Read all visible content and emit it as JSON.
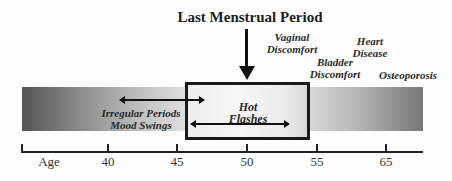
{
  "diagram": {
    "title": "Last Menstrual Period",
    "axis": {
      "label": "Age",
      "ticks": [
        "40",
        "45",
        "50",
        "55",
        "65"
      ]
    },
    "symptoms": {
      "irregular_periods": "Irregular Periods",
      "mood_swings": "Mood Swings",
      "hot_flashes_line1": "Hot",
      "hot_flashes_line2": "Flashes",
      "vaginal_line1": "Vaginal",
      "vaginal_line2": "Discomfort",
      "bladder_line1": "Bladder",
      "bladder_line2": "Discomfort",
      "heart_line1": "Heart",
      "heart_line2": "Disease",
      "osteoporosis": "Osteoporosis"
    },
    "colors": {
      "bar_dark": "#555555",
      "bar_light": "#f2f2f2",
      "ink": "#111111"
    }
  }
}
